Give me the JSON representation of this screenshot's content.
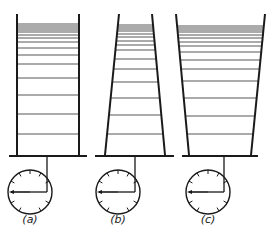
{
  "figure": {
    "panels": [
      {
        "label": "(a)",
        "shape": "cylinder",
        "walls": {
          "top_left": 17,
          "top_right": 79,
          "bottom_left": 17,
          "bottom_right": 79,
          "top_y": 14,
          "bottom_y": 155
        },
        "base": {
          "x1": 9,
          "x2": 87,
          "y": 156
        },
        "levels_y": [
          24,
          26,
          28,
          30,
          32,
          35,
          38,
          42,
          48,
          55,
          64,
          78,
          95,
          114,
          134
        ],
        "clock": {
          "cx": 30,
          "cy": 192,
          "r": 22,
          "stem_x": 47
        },
        "label_pos": {
          "x": 30,
          "y": 213
        }
      },
      {
        "label": "(b)",
        "shape": "narrow-top",
        "walls": {
          "top_left": 119,
          "top_right": 152,
          "bottom_left": 105,
          "bottom_right": 165,
          "top_y": 14,
          "bottom_y": 155
        },
        "base": {
          "x1": 95,
          "x2": 174,
          "y": 156
        },
        "levels_y": [
          25,
          27,
          29,
          31,
          34,
          37,
          41,
          45,
          50,
          59,
          69,
          82,
          98,
          115,
          134
        ],
        "clock": {
          "cx": 118,
          "cy": 192,
          "r": 22,
          "stem_x": 135
        },
        "label_pos": {
          "x": 118,
          "y": 213
        }
      },
      {
        "label": "(c)",
        "shape": "wide-top",
        "walls": {
          "top_left": 176,
          "top_right": 265,
          "bottom_left": 189,
          "bottom_right": 251,
          "top_y": 14,
          "bottom_y": 155
        },
        "base": {
          "x1": 182,
          "x2": 258,
          "y": 156
        },
        "levels_y": [
          26,
          28,
          30,
          32,
          35,
          38,
          42,
          46,
          52,
          60,
          69,
          81,
          98,
          116,
          134
        ],
        "clock": {
          "cx": 208,
          "cy": 192,
          "r": 22,
          "stem_x": 224
        },
        "label_pos": {
          "x": 208,
          "y": 213
        }
      }
    ],
    "colors": {
      "ink": "#1a1a1a",
      "levels": "#444444",
      "background": "#ffffff"
    }
  }
}
